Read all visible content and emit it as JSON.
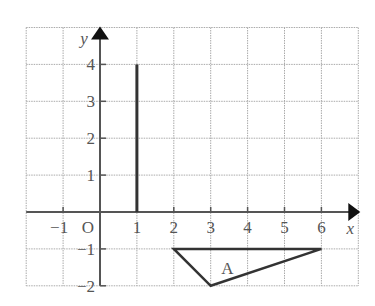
{
  "diagram": {
    "type": "coordinate-grid",
    "x_range": [
      -2,
      7
    ],
    "y_range": [
      -2,
      5
    ],
    "x_axis_label": "x",
    "y_axis_label": "y",
    "origin_label": "O",
    "x_ticks": [
      {
        "value": -1,
        "label": "−1"
      },
      {
        "value": 1,
        "label": "1"
      },
      {
        "value": 2,
        "label": "2"
      },
      {
        "value": 3,
        "label": "3"
      },
      {
        "value": 4,
        "label": "4"
      },
      {
        "value": 5,
        "label": "5"
      },
      {
        "value": 6,
        "label": "6"
      }
    ],
    "y_ticks": [
      {
        "value": 4,
        "label": "4"
      },
      {
        "value": 3,
        "label": "3"
      },
      {
        "value": 2,
        "label": "2"
      },
      {
        "value": 1,
        "label": "1"
      },
      {
        "value": -1,
        "label": "−1"
      },
      {
        "value": -2,
        "label": "−2"
      }
    ],
    "line_segment": {
      "from": [
        1,
        0
      ],
      "to": [
        1,
        4
      ]
    },
    "triangle": {
      "label": "A",
      "vertices": [
        [
          2,
          -1
        ],
        [
          6,
          -1
        ],
        [
          3,
          -2
        ]
      ]
    },
    "colors": {
      "grid": "#aaaaaa",
      "axis": "#555555",
      "shape": "#333333"
    }
  }
}
